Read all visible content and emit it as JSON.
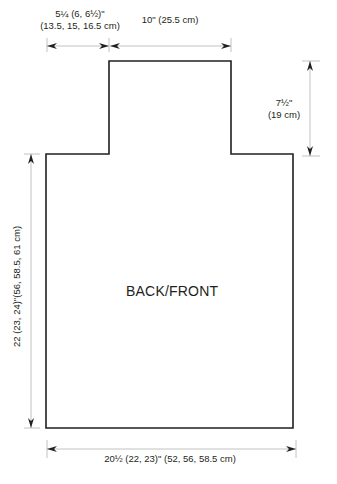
{
  "piece": {
    "title": "BACK/FRONT"
  },
  "dimensions": {
    "shoulder_width": {
      "line1": "5¼ (6, 6½)\"",
      "line2": "(13.5, 15, 16.5 cm)"
    },
    "neck_width": {
      "label": "10\" (25.5 cm)"
    },
    "neck_depth": {
      "line1": "7½\"",
      "line2": "(19 cm)"
    },
    "body_length": {
      "label": "22 (23, 24)\"(56, 58.5, 61 cm)"
    },
    "body_width": {
      "label": "20½ (22, 23)\" (52, 56, 58.5 cm)"
    }
  },
  "colors": {
    "outline": "#231f20",
    "dimension_line": "#b3b3b3",
    "arrow": "#231f20"
  }
}
